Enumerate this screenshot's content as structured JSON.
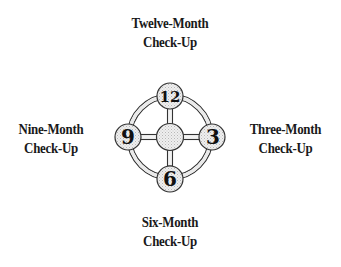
{
  "diagram": {
    "type": "clock-wheel",
    "center_hub": {
      "label": ""
    },
    "nodes": [
      {
        "position": "top",
        "number": "12",
        "label_line1": "Twelve-Month",
        "label_line2": "Check-Up"
      },
      {
        "position": "right",
        "number": "3",
        "label_line1": "Three-Month",
        "label_line2": "Check-Up"
      },
      {
        "position": "bottom",
        "number": "6",
        "label_line1": "Six-Month",
        "label_line2": "Check-Up"
      },
      {
        "position": "left",
        "number": "9",
        "label_line1": "Nine-Month",
        "label_line2": "Check-Up"
      }
    ],
    "colors": {
      "stroke": "#333333",
      "fill_stipple": "#e2e2e2",
      "background": "#ffffff",
      "text": "#1a1a1a"
    }
  }
}
